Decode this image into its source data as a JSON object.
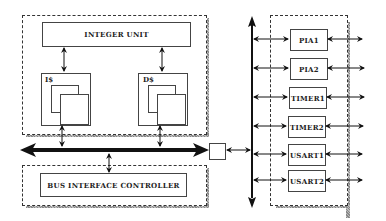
{
  "diagram": {
    "cpu": {
      "integer_unit": "INTEGER UNIT",
      "icache": "I$",
      "dcache": "D$"
    },
    "bus_interface": "BUS INTERFACE CONTROLLER",
    "peripherals": [
      "PIA1",
      "PIA2",
      "TIMER1",
      "TIMER2",
      "USART1",
      "USART2"
    ]
  }
}
